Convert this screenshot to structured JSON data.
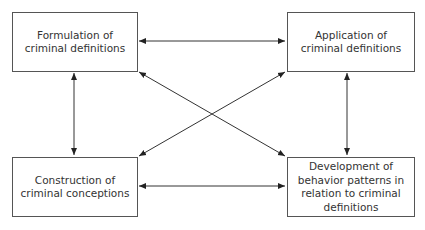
{
  "diagram": {
    "type": "concept-relationship",
    "nodes": {
      "formulation": {
        "label": "Formulation of\ncriminal definitions"
      },
      "application": {
        "label": "Application of\ncriminal definitions"
      },
      "construction": {
        "label": "Construction of\ncriminal conceptions"
      },
      "development": {
        "label": "Development of\nbehavior patterns in\nrelation to criminal\ndefinitions"
      }
    },
    "edges": [
      {
        "from": "formulation",
        "to": "application",
        "direction": "both"
      },
      {
        "from": "construction",
        "to": "development",
        "direction": "both"
      },
      {
        "from": "formulation",
        "to": "construction",
        "direction": "both"
      },
      {
        "from": "application",
        "to": "development",
        "direction": "both"
      },
      {
        "from": "formulation",
        "to": "development",
        "direction": "both"
      },
      {
        "from": "application",
        "to": "construction",
        "direction": "both"
      }
    ],
    "colors": {
      "line": "#333333",
      "border": "#555555",
      "text": "#333333"
    }
  }
}
